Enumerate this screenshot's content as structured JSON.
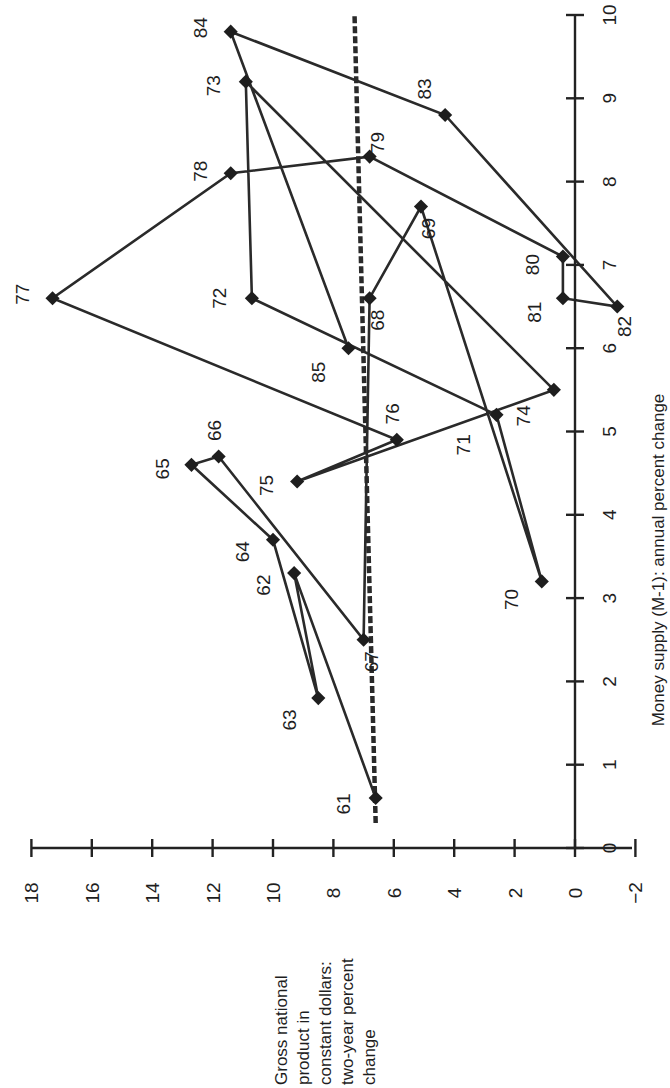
{
  "chart_data": {
    "type": "scatter",
    "subtype": "connected-scatter",
    "orientation_note": "Figure is printed rotated 90 degrees counter-clockwise",
    "title": "",
    "xlabel": "Money supply (M-1): annual percent change",
    "ylabel": "Gross national product in constant dollars: two-year percent change",
    "ylabel_lines": [
      "Gross national",
      "product in",
      "constant dollars:",
      "two-year percent",
      "change"
    ],
    "xlim": [
      0,
      10
    ],
    "ylim": [
      -2,
      18
    ],
    "x_ticks": [
      "0",
      "1",
      "2",
      "3",
      "4",
      "5",
      "6",
      "7",
      "8",
      "9",
      "10"
    ],
    "y_ticks": [
      "-2",
      "0",
      "2",
      "4",
      "6",
      "8",
      "10",
      "12",
      "14",
      "16",
      "18"
    ],
    "y_tick_labels": [
      "−2",
      "0",
      "2",
      "4",
      "6",
      "8",
      "10",
      "12",
      "14",
      "16",
      "18"
    ],
    "grid": false,
    "legend": null,
    "series": [
      {
        "name": "Annual observations 1961-1985",
        "connected": true,
        "points": [
          {
            "label": "61",
            "x": 0.6,
            "y": 6.6
          },
          {
            "label": "62",
            "x": 3.3,
            "y": 9.3
          },
          {
            "label": "63",
            "x": 1.8,
            "y": 8.5
          },
          {
            "label": "64",
            "x": 3.7,
            "y": 10.0
          },
          {
            "label": "65",
            "x": 4.6,
            "y": 12.7
          },
          {
            "label": "66",
            "x": 4.7,
            "y": 11.8
          },
          {
            "label": "67",
            "x": 2.5,
            "y": 7.0
          },
          {
            "label": "68",
            "x": 6.6,
            "y": 6.8
          },
          {
            "label": "69",
            "x": 7.7,
            "y": 5.1
          },
          {
            "label": "70",
            "x": 3.2,
            "y": 1.1
          },
          {
            "label": "71",
            "x": 5.2,
            "y": 2.6
          },
          {
            "label": "72",
            "x": 6.6,
            "y": 10.7
          },
          {
            "label": "73",
            "x": 9.2,
            "y": 10.9
          },
          {
            "label": "74",
            "x": 5.5,
            "y": 0.7
          },
          {
            "label": "75",
            "x": 4.4,
            "y": 9.2
          },
          {
            "label": "76",
            "x": 4.9,
            "y": 5.9
          },
          {
            "label": "77",
            "x": 6.6,
            "y": 17.3
          },
          {
            "label": "78",
            "x": 8.1,
            "y": 11.4
          },
          {
            "label": "79",
            "x": 8.3,
            "y": 6.8
          },
          {
            "label": "80",
            "x": 7.1,
            "y": 0.4
          },
          {
            "label": "81",
            "x": 6.6,
            "y": 0.4
          },
          {
            "label": "82",
            "x": 6.5,
            "y": -1.4
          },
          {
            "label": "83",
            "x": 8.8,
            "y": 4.3
          },
          {
            "label": "84",
            "x": 9.8,
            "y": 11.4
          },
          {
            "label": "85",
            "x": 6.0,
            "y": 7.5
          }
        ]
      }
    ],
    "reference_line": {
      "style": "dashed",
      "from": {
        "x": 0.3,
        "y": 6.6
      },
      "to": {
        "x": 10.0,
        "y": 7.3
      }
    }
  }
}
